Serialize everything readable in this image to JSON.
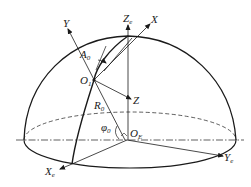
{
  "diagram": {
    "type": "hemisphere-coordinate-frames",
    "colors": {
      "line": "#1a1a1a",
      "background": "#ffffff"
    },
    "labels": {
      "Ze": {
        "main": "Z",
        "sub": "e"
      },
      "X": {
        "main": "X",
        "sub": ""
      },
      "Y": {
        "main": "Y",
        "sub": ""
      },
      "A0": {
        "main": "A",
        "sub": "0"
      },
      "O1": {
        "main": "O",
        "sub": "1"
      },
      "Z": {
        "main": "Z",
        "sub": ""
      },
      "R0": {
        "main": "R",
        "sub": "0"
      },
      "phi0": {
        "main": "φ",
        "sub": "0"
      },
      "OE": {
        "main": "O",
        "sub": "E"
      },
      "Xe": {
        "main": "X",
        "sub": "e"
      },
      "Ye": {
        "main": "Y",
        "sub": "e"
      }
    }
  }
}
